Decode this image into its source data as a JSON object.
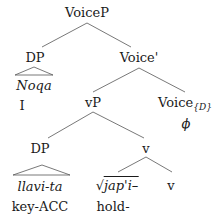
{
  "tree": {
    "root": "VoiceP",
    "dp_subject": {
      "label": "DP",
      "word": "Noqa",
      "gloss": "I"
    },
    "voice_bar": "Voice'",
    "vp": "vP",
    "voice_head": {
      "label": "Voice",
      "subscript": "{D}",
      "content": "ϕ"
    },
    "dp_object": {
      "label": "DP",
      "word": "llavi-ta",
      "gloss_stem": "key-",
      "gloss_case": "ACC"
    },
    "v_phrase": "v",
    "root_node": {
      "radical": "√",
      "form": "jap'i–",
      "gloss": "hold-"
    },
    "v_head": "v"
  }
}
